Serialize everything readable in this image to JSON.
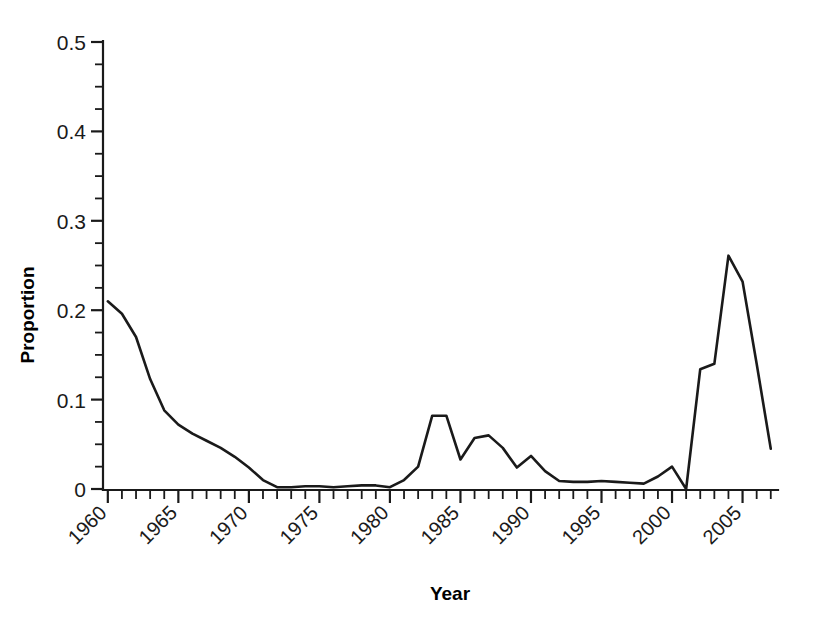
{
  "chart_data": {
    "type": "line",
    "title": "",
    "xlabel": "Year",
    "ylabel": "Proportion",
    "xlim": [
      1959.8,
      2007.3
    ],
    "ylim": [
      0,
      0.5
    ],
    "grid": false,
    "legend": null,
    "line_color": "#1a1a1a",
    "background_color": "#ffffff",
    "x_tick_labels": [
      "1960",
      "1965",
      "1970",
      "1975",
      "1980",
      "1985",
      "1990",
      "1995",
      "2000",
      "2005"
    ],
    "x_tick_values": [
      1960,
      1965,
      1970,
      1975,
      1980,
      1985,
      1990,
      1995,
      2000,
      2005
    ],
    "x_minor_tick_step": 1,
    "x_tick_label_rotation": 45,
    "y_tick_labels": [
      "0",
      "0.1",
      "0.2",
      "0.3",
      "0.4",
      "0.5"
    ],
    "y_tick_values": [
      0,
      0.1,
      0.2,
      0.3,
      0.4,
      0.5
    ],
    "y_minor_tick_step": 0.025,
    "x": [
      1960,
      1961,
      1962,
      1963,
      1964,
      1965,
      1966,
      1967,
      1968,
      1969,
      1970,
      1971,
      1972,
      1973,
      1974,
      1975,
      1976,
      1977,
      1978,
      1979,
      1980,
      1981,
      1982,
      1983,
      1984,
      1985,
      1986,
      1987,
      1988,
      1989,
      1990,
      1991,
      1992,
      1993,
      1994,
      1995,
      1996,
      1997,
      1998,
      1999,
      2000,
      2001,
      2002,
      2003,
      2004,
      2005,
      2006,
      2007
    ],
    "values": [
      0.21,
      0.196,
      0.17,
      0.123,
      0.088,
      0.072,
      0.062,
      0.054,
      0.046,
      0.036,
      0.024,
      0.01,
      0.002,
      0.002,
      0.003,
      0.003,
      0.002,
      0.003,
      0.004,
      0.004,
      0.002,
      0.01,
      0.025,
      0.082,
      0.082,
      0.033,
      0.057,
      0.06,
      0.046,
      0.024,
      0.037,
      0.02,
      0.009,
      0.008,
      0.008,
      0.009,
      0.008,
      0.007,
      0.006,
      0.014,
      0.025,
      0.0,
      0.134,
      0.14,
      0.261,
      0.232,
      0.14,
      0.045
    ]
  },
  "axes": {
    "ylabel": "Proportion",
    "xlabel": "Year"
  }
}
